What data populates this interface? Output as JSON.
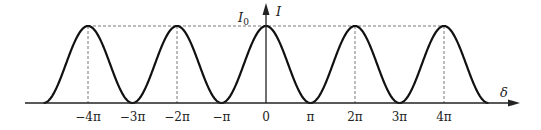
{
  "diagram": {
    "y_axis_label": "I",
    "x_axis_label": "δ",
    "peak_label": "I",
    "peak_label_sub": "0",
    "tick_labels": [
      "−4π",
      "−3π",
      "−2π",
      "−π",
      "0",
      "π",
      "2π",
      "3π",
      "4π"
    ],
    "colors": {
      "curve": "#111111",
      "axis": "#222222",
      "dash": "#555555"
    }
  },
  "chart_data": {
    "type": "line",
    "title": "",
    "xlabel": "δ",
    "ylabel": "I",
    "function": "I = I0 * cos^2(δ/2)",
    "x_ticks": [
      "−4π",
      "−3π",
      "−2π",
      "−π",
      "0",
      "π",
      "2π",
      "3π",
      "4π"
    ],
    "x_range": [
      "−5π",
      "5π"
    ],
    "maxima_at": [
      "−4π",
      "−2π",
      "0",
      "2π",
      "4π"
    ],
    "minima_at": [
      "−5π",
      "−3π",
      "−π",
      "π",
      "3π",
      "5π"
    ],
    "max_value": "I0",
    "min_value": 0,
    "dashed_guides": "vertical at maxima; horizontal at I0"
  }
}
